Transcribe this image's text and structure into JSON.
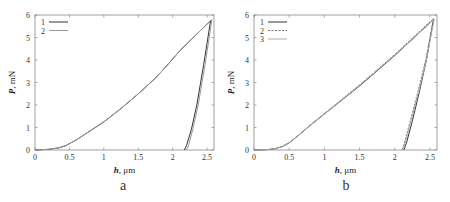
{
  "chart_data": [
    {
      "panel": "a",
      "type": "line",
      "title": "",
      "xlabel": "h, μm",
      "ylabel": "P, mN",
      "xlim": [
        0,
        2.6
      ],
      "ylim": [
        0,
        6
      ],
      "xticks": [
        "0",
        "0.5",
        "1",
        "1.5",
        "2",
        "2.5"
      ],
      "yticks": [
        "0",
        "1",
        "2",
        "3",
        "4",
        "5",
        "6"
      ],
      "grid": false,
      "legend_position": "upper-left",
      "series": [
        {
          "name": "1",
          "style": "solid",
          "color": "#333333",
          "loading": {
            "x": [
              0,
              0.2,
              0.35,
              0.45,
              0.6,
              0.8,
              1.0,
              1.25,
              1.5,
              1.75,
              1.9,
              2.1,
              2.3,
              2.55
            ],
            "y": [
              0,
              0.03,
              0.1,
              0.2,
              0.45,
              0.85,
              1.25,
              1.85,
              2.5,
              3.2,
              3.7,
              4.4,
              5.0,
              5.75
            ]
          },
          "unloading": {
            "x": [
              2.55,
              2.45,
              2.35,
              2.27,
              2.2,
              2.17
            ],
            "y": [
              5.75,
              3.8,
              2.0,
              0.9,
              0.2,
              0
            ]
          }
        },
        {
          "name": "2",
          "style": "solid",
          "color": "#999999",
          "loading": {
            "x": [
              0,
              0.2,
              0.35,
              0.45,
              0.6,
              0.8,
              1.0,
              1.25,
              1.5,
              1.75,
              1.9,
              2.1,
              2.3,
              2.57
            ],
            "y": [
              0,
              0.03,
              0.1,
              0.2,
              0.45,
              0.85,
              1.25,
              1.85,
              2.5,
              3.2,
              3.7,
              4.4,
              5.0,
              5.8
            ]
          },
          "unloading": {
            "x": [
              2.57,
              2.47,
              2.37,
              2.29,
              2.23,
              2.2
            ],
            "y": [
              5.8,
              3.8,
              2.0,
              0.9,
              0.2,
              0
            ]
          }
        }
      ],
      "caption": "a"
    },
    {
      "panel": "b",
      "type": "line",
      "title": "",
      "xlabel": "h, μm",
      "ylabel": "P, mN",
      "xlim": [
        0,
        2.6
      ],
      "ylim": [
        0,
        6
      ],
      "xticks": [
        "0",
        "0.5",
        "1",
        "1.5",
        "2",
        "2.5"
      ],
      "yticks": [
        "0",
        "1",
        "2",
        "3",
        "4",
        "5",
        "6"
      ],
      "grid": false,
      "legend_position": "upper-left",
      "series": [
        {
          "name": "1",
          "style": "solid",
          "color": "#333333",
          "loading": {
            "x": [
              0,
              0.2,
              0.3,
              0.4,
              0.5,
              0.65,
              0.8,
              1.0,
              1.5,
              2.0,
              2.55
            ],
            "y": [
              0,
              0.02,
              0.06,
              0.15,
              0.32,
              0.7,
              1.1,
              1.6,
              2.85,
              4.2,
              5.8
            ]
          },
          "unloading": {
            "x": [
              2.55,
              2.45,
              2.35,
              2.25,
              2.17,
              2.13
            ],
            "y": [
              5.8,
              4.0,
              2.6,
              1.3,
              0.35,
              0
            ]
          }
        },
        {
          "name": "2",
          "style": "dashed",
          "color": "#777777",
          "loading": {
            "x": [
              0,
              0.2,
              0.3,
              0.4,
              0.5,
              0.65,
              0.8,
              1.0,
              1.5,
              2.0,
              2.55
            ],
            "y": [
              0,
              0.02,
              0.06,
              0.15,
              0.32,
              0.7,
              1.12,
              1.62,
              2.9,
              4.25,
              5.85
            ]
          },
          "unloading": {
            "x": [
              2.55,
              2.44,
              2.33,
              2.22,
              2.14,
              2.1
            ],
            "y": [
              5.85,
              4.0,
              2.6,
              1.3,
              0.35,
              0
            ]
          }
        },
        {
          "name": "3",
          "style": "solid",
          "color": "#aaaaaa",
          "loading": {
            "x": [
              0,
              0.2,
              0.3,
              0.4,
              0.5,
              0.65,
              0.8,
              1.0,
              1.5,
              2.0,
              2.56
            ],
            "y": [
              0,
              0.02,
              0.06,
              0.15,
              0.32,
              0.7,
              1.1,
              1.6,
              2.87,
              4.22,
              5.82
            ]
          },
          "unloading": {
            "x": [
              2.56,
              2.45,
              2.34,
              2.23,
              2.15,
              2.11
            ],
            "y": [
              5.82,
              4.0,
              2.6,
              1.3,
              0.35,
              0
            ]
          }
        }
      ],
      "caption": "b"
    }
  ]
}
